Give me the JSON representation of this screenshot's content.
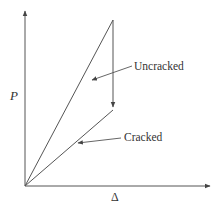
{
  "diagram": {
    "title": "",
    "axes": {
      "y_label": "P",
      "x_label": "Δ",
      "origin": [
        25,
        186
      ],
      "y_end": [
        25,
        10
      ],
      "x_end": [
        211,
        186
      ]
    },
    "curves": {
      "uncracked": {
        "from": [
          25,
          186
        ],
        "to": [
          113,
          20
        ]
      },
      "drop": {
        "from": [
          113,
          20
        ],
        "to": [
          113,
          108
        ]
      },
      "cracked": {
        "from": [
          25,
          186
        ],
        "to": [
          113,
          110
        ]
      }
    },
    "annotations": [
      {
        "text": "Uncracked",
        "label_pos": [
          134,
          70
        ],
        "arrow_from": [
          132,
          66
        ],
        "arrow_to": [
          91,
          80
        ]
      },
      {
        "text": "Cracked",
        "label_pos": [
          124,
          141
        ],
        "arrow_from": [
          121,
          138
        ],
        "arrow_to": [
          77,
          143
        ]
      }
    ],
    "colors": {
      "line": "#555555",
      "text": "#333333",
      "background": "#ffffff"
    }
  }
}
